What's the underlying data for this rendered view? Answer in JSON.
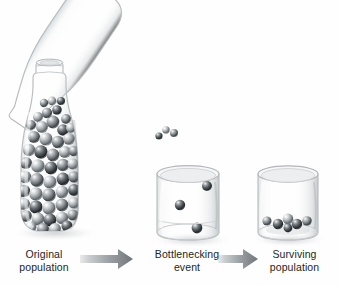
{
  "figure": {
    "title": "Population bottleneck",
    "background_color": "#ffffff",
    "text_color": "#241f20",
    "marble_color": "#6a7074",
    "glass_color": "#b9bcbe",
    "arrow_color": "#8c9295"
  },
  "stages": [
    {
      "id": "original-population",
      "label": "Original\npopulation",
      "vessel": "bottle",
      "vessel_state": "upright, full",
      "marble_count": 62,
      "description": "Tall glass bottle densely filled with gray marbles"
    },
    {
      "id": "bottlenecking-event",
      "label": "Bottlenecking\nevent",
      "vessel": "beaker",
      "vessel_state": "receiving marbles from tilted bottle neck",
      "marble_count": 3,
      "description": "Marbles falling through the narrow bottle neck into a beaker"
    },
    {
      "id": "surviving-population",
      "label": "Surviving\npopulation",
      "vessel": "beaker",
      "vessel_state": "upright, few marbles at bottom",
      "marble_count": 6,
      "description": "Beaker holding only the marbles that passed through the bottleneck"
    }
  ],
  "pouring_bottle": {
    "id": "pouring-bottle",
    "state": "tilted, pouring",
    "tilt_degrees": -56,
    "marble_count": 48,
    "description": "Bottle tipped down to the right, marbles streaming out of the neck"
  },
  "arrows": [
    {
      "id": "arrow-1",
      "from": "original-population",
      "to": "bottlenecking-event",
      "direction": "right"
    },
    {
      "id": "arrow-2",
      "from": "bottlenecking-event",
      "to": "surviving-population",
      "direction": "right"
    }
  ]
}
